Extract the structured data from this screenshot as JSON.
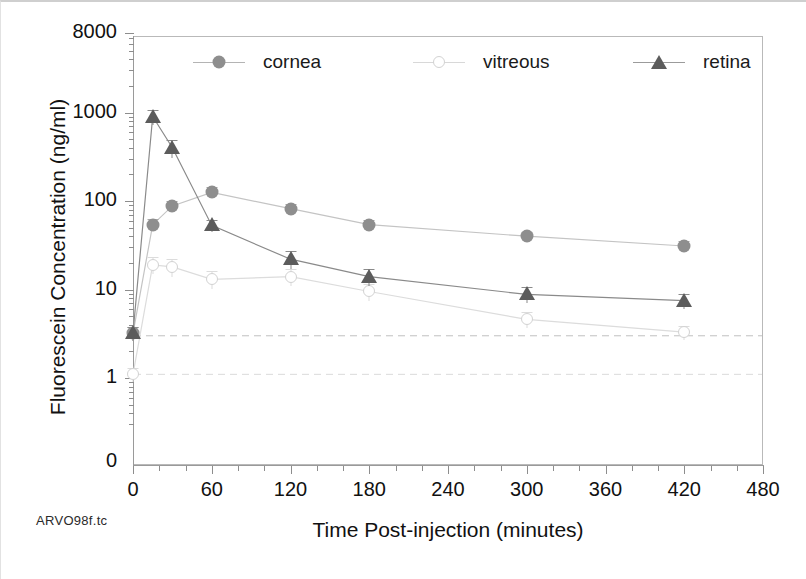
{
  "caption": "ARVO98f.tc",
  "chart_data": {
    "type": "line",
    "title": "",
    "xlabel": "Time Post-injection (minutes)",
    "ylabel": "Fluorescein Concentration (ng/ml)",
    "yscale": "log",
    "xlim": [
      0,
      480
    ],
    "ylim": [
      1,
      8000
    ],
    "grid": false,
    "legend_position": "top-inside",
    "x_ticks": [
      0,
      60,
      120,
      180,
      240,
      300,
      360,
      420,
      480
    ],
    "x_tick_labels": [
      "0",
      "60",
      "120",
      "180",
      "240",
      "300",
      "360",
      "420",
      "480"
    ],
    "x_minor_interval": 20,
    "y_ticks": [
      1,
      10,
      100,
      1000,
      8000
    ],
    "y_tick_labels": [
      "1",
      "10",
      "100",
      "1000",
      "8000"
    ],
    "y_axis_origin_label": "0",
    "x": [
      0,
      15,
      30,
      60,
      120,
      180,
      300,
      420
    ],
    "series": [
      {
        "name": "cornea",
        "marker": "filled-circle",
        "color": "#8e8e8e",
        "values": [
          3.2,
          54,
          88,
          125,
          82,
          54,
          40,
          31
        ],
        "err_low": [
          0.6,
          8,
          12,
          18,
          10,
          7,
          5,
          4
        ],
        "err_high": [
          0.6,
          8,
          12,
          18,
          10,
          7,
          5,
          4
        ]
      },
      {
        "name": "vitreous",
        "marker": "open-circle",
        "color": "#d2d2d2",
        "values": [
          1.1,
          19,
          18,
          13,
          14,
          9.5,
          4.6,
          3.3
        ],
        "err_low": [
          0.2,
          4,
          4,
          3,
          3,
          2,
          0.9,
          0.6
        ],
        "err_high": [
          0.2,
          4,
          4,
          3,
          3,
          2,
          0.9,
          0.6
        ]
      },
      {
        "name": "retina",
        "marker": "filled-triangle",
        "color": "#5c5c5c",
        "values": [
          3.2,
          900,
          400,
          53,
          22,
          14,
          8.8,
          7.5
        ],
        "err_low": [
          0.6,
          180,
          90,
          8,
          5,
          3,
          1.8,
          1.5
        ],
        "err_high": [
          0.6,
          180,
          90,
          8,
          5,
          3,
          1.8,
          1.5
        ]
      }
    ],
    "reference_lines": [
      {
        "name": "cornea-baseline",
        "y": 3.0,
        "style": "dashed",
        "color": "#c0c0c0"
      },
      {
        "name": "vitreous-baseline",
        "y": 1.1,
        "style": "dashed",
        "color": "#dadada"
      }
    ]
  }
}
